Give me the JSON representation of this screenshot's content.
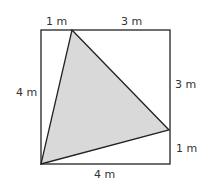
{
  "diagram": {
    "colors": {
      "stroke": "#222222",
      "fill": "#d9d9d9",
      "text": "#333333"
    },
    "labels": {
      "top_left": "1 m",
      "top_right": "3 m",
      "left": "4 m",
      "right_upper": "3 m",
      "right_lower": "1 m",
      "bottom": "4 m"
    }
  }
}
